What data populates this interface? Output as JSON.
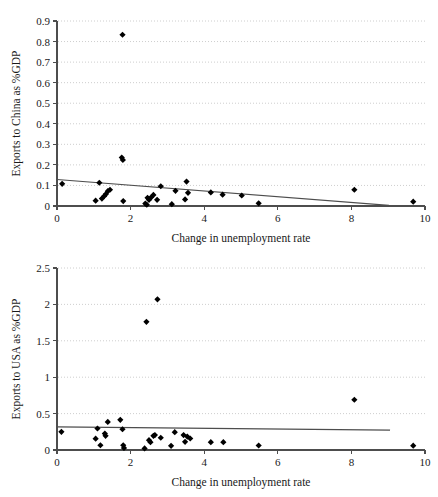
{
  "figure": {
    "background": "#ffffff",
    "marker_color": "#000000",
    "trendline_color": "#4d4d4d",
    "gridline_color": "#c8c8c8",
    "axis_color": "#4d4d4d"
  },
  "chart_data": [
    {
      "id": "china",
      "type": "scatter",
      "title": "",
      "xlabel": "Change in unemployment rate",
      "ylabel": "Exports to China as %GDP",
      "xlim": [
        0,
        10
      ],
      "ylim": [
        0,
        0.9
      ],
      "xticks": [
        0,
        2,
        4,
        6,
        8,
        10
      ],
      "xticklabels": [
        "0",
        "2",
        "4",
        "6",
        "8",
        "10"
      ],
      "yticks": [
        0,
        0.1,
        0.2,
        0.3,
        0.4,
        0.5,
        0.6,
        0.7,
        0.8,
        0.9
      ],
      "yticklabels": [
        "0",
        "0.1",
        "0.2",
        "0.3",
        "0.4",
        "0.5",
        "0.6",
        "0.7",
        "0.8",
        "0.9"
      ],
      "grid": "horizontal-dotted",
      "legend": "none",
      "marker": "diamond",
      "points": [
        {
          "x": 0.14,
          "y": 0.108
        },
        {
          "x": 1.05,
          "y": 0.026
        },
        {
          "x": 1.15,
          "y": 0.113
        },
        {
          "x": 1.22,
          "y": 0.036
        },
        {
          "x": 1.28,
          "y": 0.048
        },
        {
          "x": 1.33,
          "y": 0.058
        },
        {
          "x": 1.38,
          "y": 0.072
        },
        {
          "x": 1.44,
          "y": 0.079
        },
        {
          "x": 1.78,
          "y": 0.833
        },
        {
          "x": 1.76,
          "y": 0.236
        },
        {
          "x": 1.79,
          "y": 0.224
        },
        {
          "x": 1.8,
          "y": 0.024
        },
        {
          "x": 2.4,
          "y": 0.012
        },
        {
          "x": 2.44,
          "y": 0.006
        },
        {
          "x": 2.46,
          "y": 0.04
        },
        {
          "x": 2.5,
          "y": 0.03
        },
        {
          "x": 2.56,
          "y": 0.042
        },
        {
          "x": 2.62,
          "y": 0.054
        },
        {
          "x": 2.72,
          "y": 0.03
        },
        {
          "x": 2.82,
          "y": 0.096
        },
        {
          "x": 3.12,
          "y": 0.009
        },
        {
          "x": 3.22,
          "y": 0.074
        },
        {
          "x": 3.48,
          "y": 0.032
        },
        {
          "x": 3.52,
          "y": 0.119
        },
        {
          "x": 3.56,
          "y": 0.064
        },
        {
          "x": 4.18,
          "y": 0.066
        },
        {
          "x": 4.5,
          "y": 0.055
        },
        {
          "x": 5.02,
          "y": 0.051
        },
        {
          "x": 5.48,
          "y": 0.013
        },
        {
          "x": 8.08,
          "y": 0.079
        },
        {
          "x": 9.68,
          "y": 0.021
        }
      ],
      "trendline": {
        "x0": 0.0,
        "y0": 0.129,
        "x1": 9.02,
        "y1": 0.003
      }
    },
    {
      "id": "usa",
      "type": "scatter",
      "title": "",
      "xlabel": "Change in unemployment rate",
      "ylabel": "Exports to USA as %GDP",
      "xlim": [
        0,
        10
      ],
      "ylim": [
        0,
        2.5
      ],
      "xticks": [
        0,
        2,
        4,
        6,
        8,
        10
      ],
      "xticklabels": [
        "0",
        "2",
        "4",
        "6",
        "8",
        "10"
      ],
      "yticks": [
        0,
        0.5,
        1,
        1.5,
        2,
        2.5
      ],
      "yticklabels": [
        "0",
        "0.5",
        "1",
        "1.5",
        "2",
        "2.5"
      ],
      "grid": "horizontal-dotted",
      "legend": "none",
      "marker": "diamond",
      "points": [
        {
          "x": 0.12,
          "y": 0.25
        },
        {
          "x": 1.05,
          "y": 0.155
        },
        {
          "x": 1.1,
          "y": 0.295
        },
        {
          "x": 1.18,
          "y": 0.065
        },
        {
          "x": 1.3,
          "y": 0.225
        },
        {
          "x": 1.32,
          "y": 0.195
        },
        {
          "x": 1.38,
          "y": 0.385
        },
        {
          "x": 1.72,
          "y": 0.415
        },
        {
          "x": 1.78,
          "y": 0.285
        },
        {
          "x": 1.8,
          "y": 0.065
        },
        {
          "x": 1.82,
          "y": 0.028
        },
        {
          "x": 2.38,
          "y": 0.022
        },
        {
          "x": 2.43,
          "y": 1.76
        },
        {
          "x": 2.5,
          "y": 0.135
        },
        {
          "x": 2.54,
          "y": 0.108
        },
        {
          "x": 2.62,
          "y": 0.195
        },
        {
          "x": 2.66,
          "y": 0.205
        },
        {
          "x": 2.73,
          "y": 2.07
        },
        {
          "x": 2.82,
          "y": 0.168
        },
        {
          "x": 3.1,
          "y": 0.058
        },
        {
          "x": 3.2,
          "y": 0.245
        },
        {
          "x": 3.44,
          "y": 0.205
        },
        {
          "x": 3.48,
          "y": 0.112
        },
        {
          "x": 3.54,
          "y": 0.185
        },
        {
          "x": 3.62,
          "y": 0.158
        },
        {
          "x": 4.18,
          "y": 0.108
        },
        {
          "x": 4.52,
          "y": 0.108
        },
        {
          "x": 5.48,
          "y": 0.062
        },
        {
          "x": 8.08,
          "y": 0.69
        },
        {
          "x": 9.68,
          "y": 0.06
        }
      ],
      "trendline": {
        "x0": 0.0,
        "y0": 0.318,
        "x1": 9.05,
        "y1": 0.272
      }
    }
  ]
}
